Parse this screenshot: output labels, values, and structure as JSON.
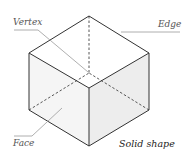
{
  "diagram": {
    "title": "Solid shape",
    "labels": {
      "vertex": "Vertex",
      "edge": "Edge",
      "face": "Face"
    },
    "colors": {
      "edge": "#333333",
      "leader": "#999999",
      "face_top": "#ffffff",
      "face_left": "#f4f4f4",
      "face_right": "#ececec"
    }
  }
}
